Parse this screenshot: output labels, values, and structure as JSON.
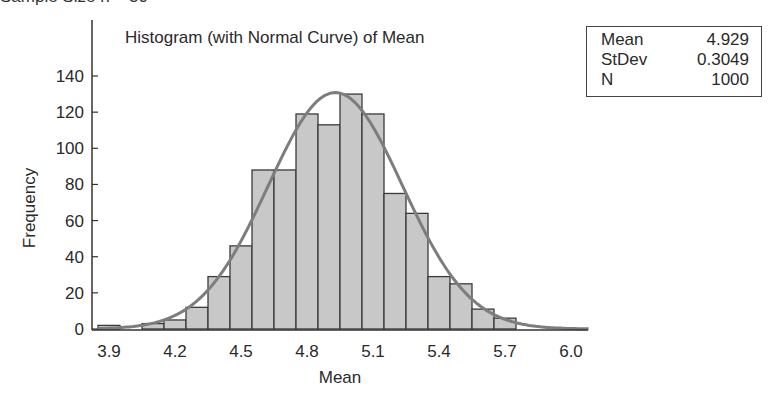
{
  "header_text": "Sample Size n = 30",
  "chart_data": {
    "type": "bar",
    "title": "Histogram (with Normal Curve) of Mean",
    "xlabel": "Mean",
    "ylabel": "Frequency",
    "x_ticks": [
      "3.9",
      "4.2",
      "4.5",
      "4.8",
      "5.1",
      "5.4",
      "5.7",
      "6.0"
    ],
    "y_ticks": [
      "0",
      "20",
      "40",
      "60",
      "80",
      "100",
      "120",
      "140"
    ],
    "xlim": [
      3.85,
      6.1
    ],
    "ylim": [
      0,
      150
    ],
    "bin_width": 0.1,
    "categories": [
      3.9,
      4.0,
      4.1,
      4.2,
      4.3,
      4.4,
      4.5,
      4.6,
      4.7,
      4.8,
      4.9,
      5.0,
      5.1,
      5.2,
      5.3,
      5.4,
      5.5,
      5.6,
      5.7
    ],
    "values": [
      2,
      0,
      3,
      5,
      12,
      29,
      46,
      88,
      88,
      119,
      113,
      130,
      119,
      75,
      64,
      29,
      25,
      11,
      6
    ],
    "normal_curve": {
      "mean": 4.929,
      "stdev": 0.3049,
      "n": 1000
    },
    "bar_color": "#c8c8c8",
    "curve_color": "#7d7d7d",
    "grid": false
  },
  "stats": [
    {
      "label": "Mean",
      "value": "4.929"
    },
    {
      "label": "StDev",
      "value": "0.3049"
    },
    {
      "label": "N",
      "value": "1000"
    }
  ]
}
